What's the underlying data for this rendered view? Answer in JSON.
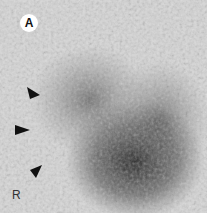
{
  "figure": {
    "panel_label": "A",
    "side_marker": "R",
    "arrowheads": [
      {
        "x": 33,
        "y": 93,
        "direction": "right-down"
      },
      {
        "x": 22,
        "y": 130,
        "direction": "right"
      },
      {
        "x": 37,
        "y": 172,
        "direction": "right-up"
      }
    ]
  }
}
